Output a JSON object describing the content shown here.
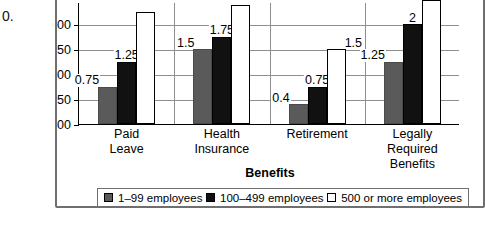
{
  "figure_fragment": "0.",
  "chart_data": {
    "type": "bar",
    "title": "",
    "xlabel": "Benefits",
    "ylabel": "Cost of Benefits",
    "categories": [
      "Paid\nLeave",
      "Health\nInsurance",
      "Retirement",
      "Legally\nRequired\nBenefits"
    ],
    "ytick_labels": [
      "$0.00",
      "$0.50",
      "$1.00",
      "$1.50",
      "$2.00"
    ],
    "ytick_values": [
      0,
      0.5,
      1.0,
      1.5,
      2.0
    ],
    "ylim": [
      0,
      2.45
    ],
    "grid": true,
    "legend_position": "bottom",
    "series": [
      {
        "name": "1–99 employees",
        "color": "#5a5a5a",
        "values": [
          0.75,
          1.5,
          0.4,
          1.25
        ],
        "labels": [
          "0.75",
          "1.5",
          "0.4",
          "1.25"
        ]
      },
      {
        "name": "100–499 employees",
        "color": "#111111",
        "values": [
          1.25,
          1.75,
          0.75,
          2
        ],
        "labels": [
          "1.25",
          "1.75",
          "0.75",
          "2"
        ]
      },
      {
        "name": "500 or more employees",
        "color": "#ffffff",
        "values": [
          2.25,
          2.4,
          1.5,
          2.5
        ],
        "labels": [
          "",
          "",
          "1.5",
          ""
        ]
      }
    ]
  },
  "legend": {
    "items": [
      {
        "label": "1–99 employees",
        "swatch": "gray"
      },
      {
        "label": "100–499 employees",
        "swatch": "black"
      },
      {
        "label": "500 or more employees",
        "swatch": "white"
      }
    ]
  }
}
